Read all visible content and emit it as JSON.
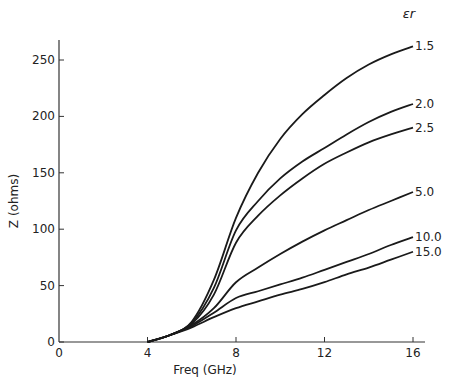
{
  "chart_data": {
    "type": "line",
    "title": "",
    "xlabel": "Freq (GHz)",
    "ylabel": "Z (ohms)",
    "xlim": [
      0,
      16.5
    ],
    "ylim": [
      0,
      265
    ],
    "x_ticks": [
      0,
      4,
      8,
      12,
      16
    ],
    "y_ticks": [
      0,
      50,
      100,
      150,
      200,
      250
    ],
    "grid": false,
    "legend_title": "εr",
    "legend_position": "right, labels at line ends",
    "series": [
      {
        "name": "1.5",
        "x": [
          4,
          5,
          6,
          7,
          8,
          9,
          10,
          11,
          12,
          13,
          14,
          15,
          16
        ],
        "values": [
          0,
          6,
          18,
          55,
          110,
          150,
          180,
          202,
          219,
          234,
          246,
          255,
          262
        ]
      },
      {
        "name": "2.0",
        "x": [
          4,
          5,
          6,
          7,
          8,
          9,
          10,
          11,
          12,
          13,
          14,
          15,
          16
        ],
        "values": [
          0,
          6,
          17,
          48,
          99,
          125,
          145,
          160,
          172,
          184,
          195,
          204,
          211
        ]
      },
      {
        "name": "2.5",
        "x": [
          4,
          5,
          6,
          7,
          8,
          9,
          10,
          11,
          12,
          13,
          14,
          15,
          16
        ],
        "values": [
          0,
          6,
          16,
          42,
          88,
          112,
          130,
          145,
          158,
          168,
          177,
          184,
          190
        ]
      },
      {
        "name": "5.0",
        "x": [
          4,
          5,
          6,
          7,
          8,
          9,
          10,
          11,
          12,
          13,
          14,
          15,
          16
        ],
        "values": [
          0,
          6,
          15,
          30,
          53,
          66,
          78,
          89,
          99,
          108,
          117,
          125,
          133
        ]
      },
      {
        "name": "10.0",
        "x": [
          4,
          5,
          6,
          7,
          8,
          9,
          10,
          11,
          12,
          13,
          14,
          15,
          16
        ],
        "values": [
          0,
          6,
          14,
          26,
          39,
          45,
          51,
          57,
          64,
          71,
          78,
          86,
          93
        ]
      },
      {
        "name": "15.0",
        "x": [
          4,
          5,
          6,
          7,
          8,
          9,
          10,
          11,
          12,
          13,
          14,
          15,
          16
        ],
        "values": [
          0,
          6,
          13,
          22,
          30,
          36,
          42,
          47,
          53,
          60,
          66,
          73,
          80
        ]
      }
    ]
  },
  "axes": {
    "xlabel": "Freq (GHz)",
    "ylabel": "Z (ohms)",
    "x_tick_labels": [
      "0",
      "4",
      "8",
      "12",
      "16"
    ],
    "y_tick_labels": [
      "0",
      "50",
      "100",
      "150",
      "200",
      "250"
    ],
    "legend_title": "εr",
    "series_labels": [
      "1.5",
      "2.0",
      "2.5",
      "5.0",
      "10.0",
      "15.0"
    ]
  }
}
